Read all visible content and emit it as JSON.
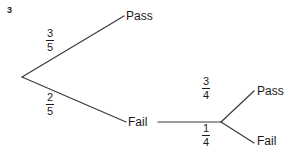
{
  "question_number": "3",
  "diagram": {
    "type": "probability-tree",
    "root": {
      "x": 22,
      "y": 77
    },
    "branches": [
      {
        "id": "pass-top",
        "probability": {
          "numerator": "3",
          "denominator": "5"
        },
        "outcome_label": "Pass",
        "from": {
          "x": 22,
          "y": 77
        },
        "to": {
          "x": 124,
          "y": 16
        }
      },
      {
        "id": "fail-top",
        "probability": {
          "numerator": "2",
          "denominator": "5"
        },
        "outcome_label": "Fail",
        "from": {
          "x": 22,
          "y": 77
        },
        "to": {
          "x": 126,
          "y": 122
        }
      },
      {
        "id": "pass-sub",
        "probability": {
          "numerator": "3",
          "denominator": "4"
        },
        "outcome_label": "Pass",
        "from": {
          "x": 221,
          "y": 122
        },
        "to": {
          "x": 254,
          "y": 91
        }
      },
      {
        "id": "fail-sub",
        "probability": {
          "numerator": "1",
          "denominator": "4"
        },
        "outcome_label": "Fail",
        "from": {
          "x": 221,
          "y": 122
        },
        "to": {
          "x": 254,
          "y": 143
        }
      }
    ],
    "connector": {
      "from": {
        "x": 158,
        "y": 122
      },
      "to": {
        "x": 221,
        "y": 122
      }
    },
    "stroke_color": "#3a3a3a",
    "text_color": "#1a1a1a",
    "background_color": "#ffffff"
  }
}
